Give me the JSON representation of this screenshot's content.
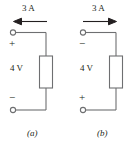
{
  "figure": {
    "background_color": "#ffffff",
    "stroke_color": "#6e6f71",
    "text_color": "#231f20",
    "width": 140,
    "height": 146
  },
  "circuits": [
    {
      "id": "a",
      "caption": "(a)",
      "current_label": "3 A",
      "current_value": 3,
      "current_unit": "A",
      "current_direction": "left",
      "voltage_label": "4 V",
      "voltage_value": 4,
      "voltage_unit": "V",
      "top_terminal_sign": "+",
      "bottom_terminal_sign": "−"
    },
    {
      "id": "b",
      "caption": "(b)",
      "current_label": "3 A",
      "current_value": 3,
      "current_unit": "A",
      "current_direction": "right",
      "voltage_label": "4 V",
      "voltage_value": 4,
      "voltage_unit": "V",
      "top_terminal_sign": "−",
      "bottom_terminal_sign": "+"
    }
  ]
}
